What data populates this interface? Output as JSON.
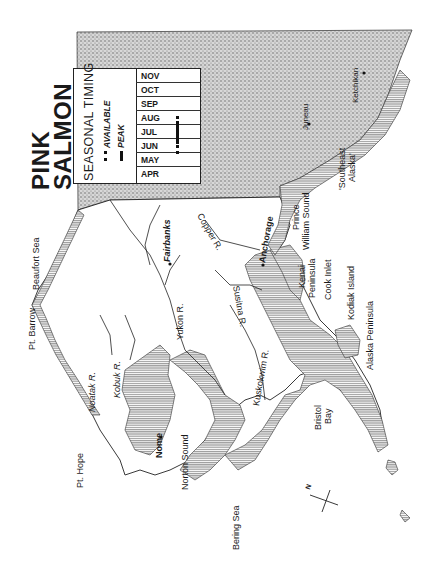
{
  "title": {
    "line1": "PINK",
    "line2": "SALMON"
  },
  "legend": {
    "heading": "SEASONAL TIMING",
    "available_label": "AVAILABLE",
    "peak_label": "PEAK",
    "months": [
      "NOV",
      "OCT",
      "SEP",
      "AUG",
      "JUL",
      "JUN",
      "MAY",
      "APR"
    ],
    "available_range": [
      "JUN",
      "AUG"
    ],
    "peak_range": [
      "JUL",
      "AUG"
    ]
  },
  "labels": {
    "pt_barrow": "Pt. Barrow",
    "beaufort_sea": "Beaufort Sea",
    "pt_hope": "Pt. Hope",
    "noatak_r": "Noatak R.",
    "kobuk_r": "Kobuk R.",
    "nome": "Nome",
    "norton_sound": "Norton Sound",
    "bering_sea": "Bering Sea",
    "yukon_r": "Yukon R.",
    "fairbanks": "Fairbanks",
    "kuskokwim_r": "Kuskokwim R.",
    "susitna_r": "Susitna R.",
    "anchorage": "Anchorage",
    "copper_r": "Copper R.",
    "prince_william_sound_1": "Prince",
    "prince_william_sound_2": "William Sound",
    "kenai_1": "Kenai",
    "kenai_2": "Peninsula",
    "cook_inlet": "Cook Inlet",
    "kodiak_island": "Kodiak Island",
    "alaska_peninsula": "Alaska Peninsula",
    "bristol_1": "Bristol",
    "bristol_2": "Bay",
    "southeast_1": "'Southeast",
    "southeast_2": "Alaska'",
    "juneau": "Juneau",
    "ketchikan": "Ketchikan",
    "north": "N"
  },
  "colors": {
    "canada_stipple": "#b8b8b8",
    "salmon_range": "#a9a9a9",
    "outline": "#222222",
    "background": "#ffffff"
  }
}
